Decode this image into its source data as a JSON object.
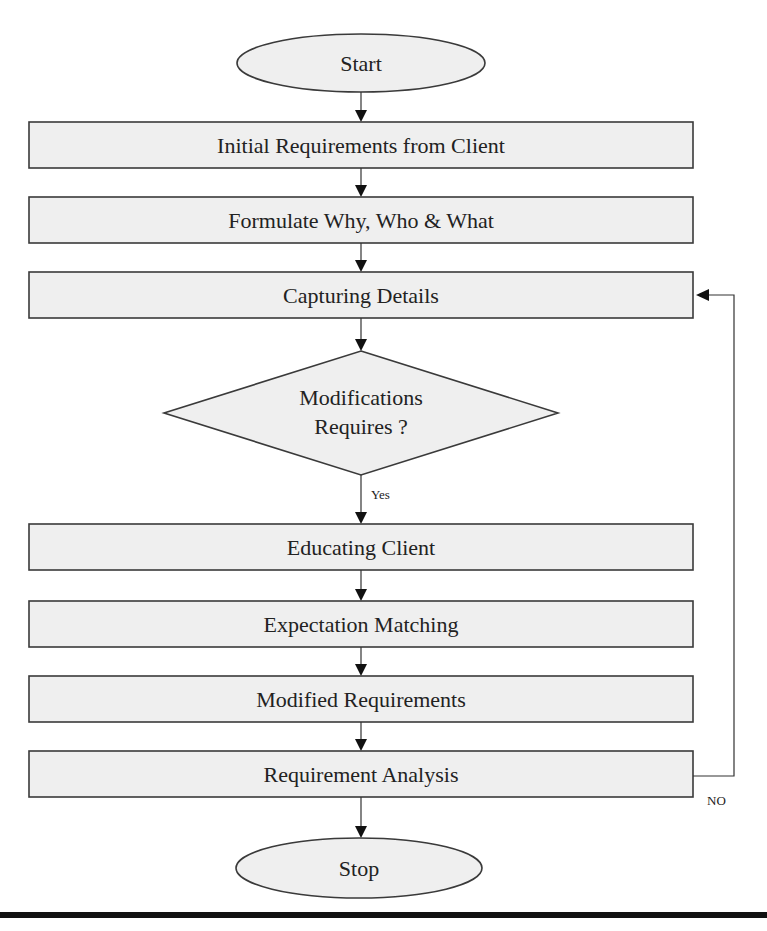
{
  "flowchart": {
    "colors": {
      "shape_fill": "#efefef",
      "shape_stroke": "#3a3a3a",
      "connector": "#333333",
      "baseline_rule": "#111111"
    },
    "nodes": [
      {
        "id": "start",
        "type": "terminator",
        "label": "Start"
      },
      {
        "id": "initial",
        "type": "process",
        "label": "Initial Requirements from Client"
      },
      {
        "id": "formulate",
        "type": "process",
        "label": "Formulate Why, Who & What"
      },
      {
        "id": "capturing",
        "type": "process",
        "label": "Capturing Details"
      },
      {
        "id": "decision",
        "type": "decision",
        "label_line1": "Modifications",
        "label_line2": "Requires ?"
      },
      {
        "id": "educating",
        "type": "process",
        "label": "Educating Client"
      },
      {
        "id": "expectation",
        "type": "process",
        "label": "Expectation Matching"
      },
      {
        "id": "modified",
        "type": "process",
        "label": "Modified Requirements"
      },
      {
        "id": "analysis",
        "type": "process",
        "label": "Requirement Analysis"
      },
      {
        "id": "stop",
        "type": "terminator",
        "label": "Stop"
      }
    ],
    "edges": [
      {
        "from": "start",
        "to": "initial",
        "label": ""
      },
      {
        "from": "initial",
        "to": "formulate",
        "label": ""
      },
      {
        "from": "formulate",
        "to": "capturing",
        "label": ""
      },
      {
        "from": "capturing",
        "to": "decision",
        "label": ""
      },
      {
        "from": "decision",
        "to": "educating",
        "label": "Yes"
      },
      {
        "from": "educating",
        "to": "expectation",
        "label": ""
      },
      {
        "from": "expectation",
        "to": "modified",
        "label": ""
      },
      {
        "from": "modified",
        "to": "analysis",
        "label": ""
      },
      {
        "from": "analysis",
        "to": "stop",
        "label": ""
      },
      {
        "from": "analysis",
        "to": "capturing",
        "label": "NO"
      }
    ]
  }
}
